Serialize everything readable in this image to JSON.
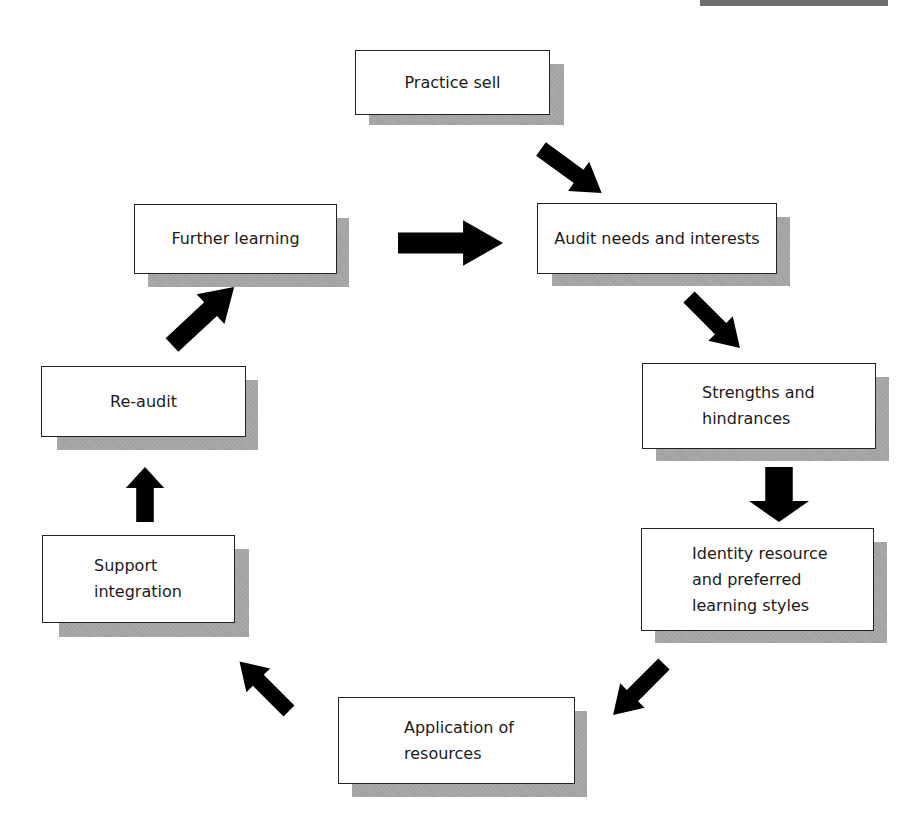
{
  "diagram": {
    "type": "cycle-flowchart",
    "decor": {
      "top_bar_color": "#6e6e6e"
    },
    "colors": {
      "box_fill": "#ffffff",
      "box_border": "#222222",
      "shadow": "#a9a9a9",
      "arrow": "#000000"
    },
    "nodes": [
      {
        "id": "practice-sell",
        "label": "Practice sell"
      },
      {
        "id": "audit-needs",
        "label": "Audit needs and interests"
      },
      {
        "id": "strengths",
        "label": "Strengths and\nhindrances"
      },
      {
        "id": "identity-resource",
        "label": "Identity resource\nand preferred\nlearning styles"
      },
      {
        "id": "application",
        "label": "Application of\nresources"
      },
      {
        "id": "support-integration",
        "label": "Support\nintegration"
      },
      {
        "id": "re-audit",
        "label": "Re-audit"
      },
      {
        "id": "further-learning",
        "label": "Further learning"
      }
    ],
    "edges": [
      {
        "from": "practice-sell",
        "to": "audit-needs",
        "direction": "down-right"
      },
      {
        "from": "further-learning",
        "to": "audit-needs",
        "direction": "right"
      },
      {
        "from": "audit-needs",
        "to": "strengths",
        "direction": "down-right"
      },
      {
        "from": "strengths",
        "to": "identity-resource",
        "direction": "down"
      },
      {
        "from": "identity-resource",
        "to": "application",
        "direction": "down-left"
      },
      {
        "from": "application",
        "to": "support-integration",
        "direction": "up-left"
      },
      {
        "from": "support-integration",
        "to": "re-audit",
        "direction": "up"
      },
      {
        "from": "re-audit",
        "to": "further-learning",
        "direction": "up-right"
      }
    ]
  }
}
